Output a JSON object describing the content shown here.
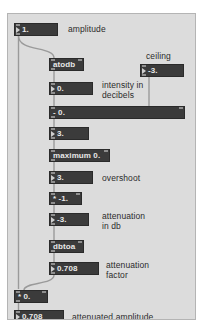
{
  "window": {
    "title": "Patcher",
    "background": "#dcdcdc",
    "box_fill": "#3b3b3b",
    "box_text": "#e8e8e8",
    "comment_text": "#2b2b2b",
    "cord_color": "#9a9a9a"
  },
  "objects": {
    "amplitude_numbox": {
      "value": "1."
    },
    "atodb": {
      "label": "atodb"
    },
    "decibels_numbox": {
      "value": "0."
    },
    "subtract": {
      "label": "- 0."
    },
    "three_numbox": {
      "value": "3."
    },
    "maximum": {
      "label": "maximum 0."
    },
    "overshoot_numbox": {
      "value": "3."
    },
    "multiply_neg1": {
      "label": "* -1."
    },
    "attenuation_db_numbox": {
      "value": "-3."
    },
    "dbtoa": {
      "label": "dbtoa"
    },
    "attenuation_factor_numbox": {
      "value": "0.708"
    },
    "multiply_sig": {
      "label": "* 0."
    },
    "attenuated_amp_numbox": {
      "value": "0.708"
    },
    "ceiling_numbox": {
      "value": "-3."
    }
  },
  "comments": {
    "amplitude": "amplitude",
    "ceiling": "ceiling",
    "intensity_in_decibels": "intensity in\ndecibels",
    "overshoot": "overshoot",
    "attenuation_in_db": "attenuation\nin db",
    "attenuation_factor": "attenuation\nfactor",
    "attenuated_amplitude": "attenuated amplitude"
  }
}
